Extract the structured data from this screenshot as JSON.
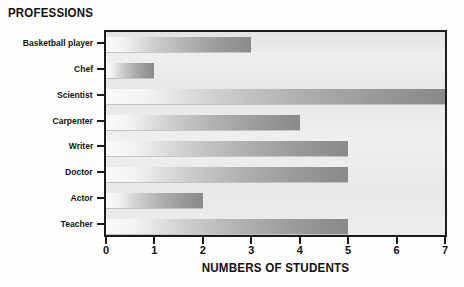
{
  "chart_data": {
    "type": "bar",
    "orientation": "horizontal",
    "title": "PROFESSIONS",
    "xlabel": "NUMBERS OF STUDENTS",
    "ylabel": "",
    "categories": [
      "Basketball player",
      "Chef",
      "Scientist",
      "Carpenter",
      "Writer",
      "Doctor",
      "Actor",
      "Teacher"
    ],
    "values": [
      3,
      1,
      7,
      4,
      5,
      5,
      2,
      5
    ],
    "xlim": [
      0,
      7
    ],
    "xticks": [
      0,
      1,
      2,
      3,
      4,
      5,
      6,
      7
    ],
    "xtick_labels": [
      "0",
      "1",
      "2",
      "3",
      "4",
      "5",
      "6",
      "7"
    ],
    "grid": false,
    "legend": null,
    "colors": {
      "bar_gradient_start": "#fafafa",
      "bar_gradient_end": "#898989",
      "plot_background": "#ebebeb",
      "axis": "#1b1b1b",
      "text": "#111111",
      "figure_background": "#fefefe"
    }
  }
}
